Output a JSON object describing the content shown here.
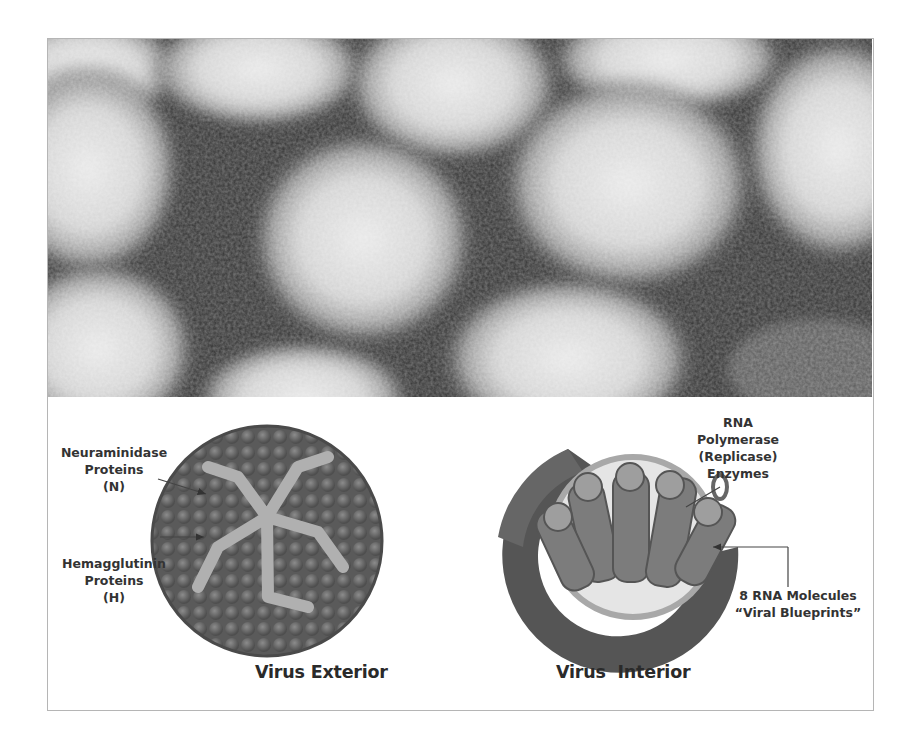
{
  "figure": {
    "photo": {
      "description": "electron micrograph of influenza virus particles",
      "colors": {
        "dark": "#2e2e2e",
        "light": "#e6e6e6"
      }
    },
    "exterior": {
      "labels": {
        "neuraminidase": [
          "Neuraminidase",
          "Proteins",
          "(N)"
        ],
        "hemagglutinin": [
          "Hemagglutinin",
          "Proteins",
          "(H)"
        ]
      },
      "caption": "Virus Exterior"
    },
    "interior": {
      "labels": {
        "polymerase": [
          "RNA",
          "Polymerase",
          "(Replicase)",
          "Enzymes"
        ],
        "rna": [
          "8 RNA Molecules",
          "“Viral Blueprints”"
        ]
      },
      "caption": "Virus  Interior"
    },
    "colors": {
      "frame": "#b5b5b5",
      "text": "#333333",
      "virus_dark": "#555555",
      "virus_mid": "#8a8a8a",
      "virus_light": "#c9c9c9"
    }
  }
}
